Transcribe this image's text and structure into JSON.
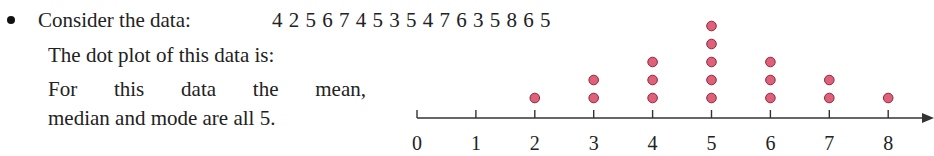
{
  "content": {
    "intro_label": "Consider the data:",
    "data_sequence": "4 2 5 6 7 4 5 3 5 4 7 6 3 5 8 6 5",
    "dot_plot_label": "The dot plot of this data is:",
    "summary_line1": "For this data the mean,",
    "summary_line2": "median and mode are all 5."
  },
  "chart_data": {
    "type": "dot",
    "title": "",
    "xlabel": "",
    "ylabel": "",
    "raw_data": [
      4,
      2,
      5,
      6,
      7,
      4,
      5,
      3,
      5,
      4,
      7,
      6,
      3,
      5,
      8,
      6,
      5
    ],
    "categories": [
      "0",
      "1",
      "2",
      "3",
      "4",
      "5",
      "6",
      "7",
      "8"
    ],
    "values": [
      0,
      0,
      1,
      2,
      3,
      5,
      3,
      2,
      1
    ],
    "xlim": [
      0,
      8
    ],
    "grid": false,
    "legend": "none",
    "dot_color": "#e0607a",
    "dot_stroke": "#8a2a3c",
    "axis_color": "#333333",
    "statistics": {
      "mean": 5,
      "median": 5,
      "mode": 5
    }
  }
}
